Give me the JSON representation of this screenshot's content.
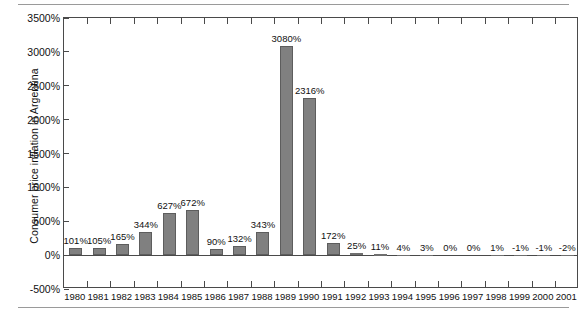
{
  "chart_data": {
    "type": "bar",
    "title": "",
    "xlabel": "",
    "ylabel": "Consumer price inflation in Argentina",
    "ylim": [
      -500,
      3500
    ],
    "ytick_labels": [
      "3500%",
      "3000%",
      "2500%",
      "2000%",
      "1500%",
      "1000%",
      "500%",
      "0%",
      "-500%"
    ],
    "ytick_values": [
      3500,
      3000,
      2500,
      2000,
      1500,
      1000,
      500,
      0,
      -500
    ],
    "grid": false,
    "legend": null,
    "bar_color": "#808080",
    "bar_edge_color": "#5d5d5d",
    "categories": [
      "1980",
      "1981",
      "1982",
      "1983",
      "1984",
      "1985",
      "1986",
      "1987",
      "1988",
      "1989",
      "1990",
      "1991",
      "1992",
      "1993",
      "1994",
      "1995",
      "1996",
      "1997",
      "1998",
      "1999",
      "2000",
      "2001"
    ],
    "values": [
      101,
      105,
      165,
      344,
      627,
      672,
      90,
      132,
      343,
      3080,
      2316,
      172,
      25,
      11,
      4,
      3,
      0,
      0,
      1,
      -1,
      -1,
      -2
    ],
    "data_labels": [
      "101%",
      "105%",
      "165%",
      "344%",
      "627%",
      "672%",
      "90%",
      "132%",
      "343%",
      "3080%",
      "2316%",
      "172%",
      "25%",
      "11%",
      "4%",
      "3%",
      "0%",
      "0%",
      "1%",
      "-1%",
      "-1%",
      "-2%"
    ]
  }
}
